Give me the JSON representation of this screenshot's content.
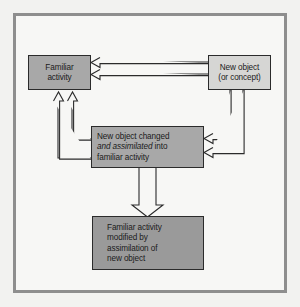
{
  "figure": {
    "background_color": "#f2f2f0",
    "frame_color": "#8e8e8e",
    "panel_color": "#f7f7f5"
  },
  "nodes": {
    "familiar_activity": {
      "id": "familiar-activity",
      "line1": "Familiar",
      "line2": "activity",
      "fill": "#a8a8a8",
      "stroke": "#2b2b2b"
    },
    "new_object": {
      "id": "new-object",
      "line1": "New object",
      "line2": "(or concept)",
      "fill": "#d6d6d4",
      "stroke": "#2b2b2b"
    },
    "assimilated": {
      "id": "new-object-changed-assimilated",
      "line1": "New object changed",
      "line2_italic": "and assimilated",
      "line2_rest": " into",
      "line3": "familiar activity",
      "fill": "#a8a8a8",
      "stroke": "#2b2b2b"
    },
    "modified": {
      "id": "familiar-activity-modified",
      "line1": "Familiar activity",
      "line2": "modified by",
      "line3": "assimilation of",
      "line4": "new object",
      "fill": "#9a9a9a",
      "stroke": "#2b2b2b"
    }
  },
  "connectors": [
    {
      "name": "new-object-to-familiar-activity-upper",
      "from": "new_object",
      "to": "familiar_activity",
      "style": "hollow-arrow",
      "direction": "left"
    },
    {
      "name": "new-object-to-familiar-activity-lower",
      "from": "new_object",
      "to": "familiar_activity",
      "style": "hollow-arrow",
      "direction": "left"
    },
    {
      "name": "new-object-to-assimilated-upper",
      "from": "new_object",
      "to": "assimilated",
      "style": "hollow-arrow",
      "direction": "left"
    },
    {
      "name": "new-object-to-assimilated-lower",
      "from": "new_object",
      "to": "assimilated",
      "style": "hollow-arrow",
      "direction": "left"
    },
    {
      "name": "assimilated-to-familiar-activity-upper",
      "from": "assimilated",
      "to": "familiar_activity",
      "style": "hollow-arrow",
      "direction": "up"
    },
    {
      "name": "assimilated-to-familiar-activity-lower",
      "from": "assimilated",
      "to": "familiar_activity",
      "style": "hollow-arrow",
      "direction": "up"
    },
    {
      "name": "assimilated-to-modified",
      "from": "assimilated",
      "to": "modified",
      "style": "hollow-arrow",
      "direction": "down"
    }
  ],
  "colors": {
    "line": "#2b2b2b",
    "arrow_fill": "#f7f7f5",
    "text": "#1a1a1a"
  }
}
